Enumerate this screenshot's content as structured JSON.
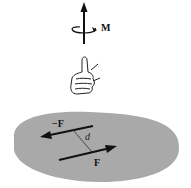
{
  "diagram": {
    "moment_label": "M",
    "force_label": "F",
    "neg_force_label": "−F",
    "distance_label": "d",
    "colors": {
      "body_fill": "#a9a9a9",
      "ink": "#111111",
      "background": "#ffffff"
    },
    "elements": [
      {
        "name": "moment-vector",
        "description": "vertical arrow pointing up with curved rotation arrow around it"
      },
      {
        "name": "right-hand-thumb",
        "description": "right hand with thumb up, fingers curled indicating rotation"
      },
      {
        "name": "rigid-body",
        "description": "gray irregular blob"
      },
      {
        "name": "force-couple",
        "description": "two equal and opposite parallel forces F and -F separated by distance d"
      }
    ]
  }
}
